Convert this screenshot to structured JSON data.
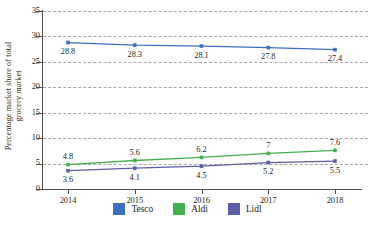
{
  "chart_data": {
    "type": "line",
    "title": "",
    "xlabel": "",
    "ylabel": "Percentage market share of total grocery market",
    "ylabel_lines": [
      "Percentage market share of total",
      "grocery market"
    ],
    "categories": [
      "2014",
      "2015",
      "2016",
      "2017",
      "2018"
    ],
    "x": [
      2014,
      2015,
      2016,
      2017,
      2018
    ],
    "ylim": [
      0,
      35
    ],
    "ytick_step": 5,
    "yticks": [
      "0",
      "5",
      "10",
      "15",
      "20",
      "25",
      "30",
      "35"
    ],
    "grid": true,
    "grid_style": "dashed-horizontal",
    "legend_position": "bottom-center",
    "data_labels": true,
    "series": [
      {
        "name": "Tesco",
        "color": "#3a6fc4",
        "values": [
          28.8,
          28.3,
          28.1,
          27.8,
          27.4
        ],
        "labels": [
          "28.8",
          "28.3",
          "28.1",
          "27.8",
          "27.4"
        ],
        "label_position": "below"
      },
      {
        "name": "Aldi",
        "color": "#42b04a",
        "values": [
          4.8,
          5.6,
          6.2,
          7,
          7.6
        ],
        "labels": [
          "4.8",
          "5.6",
          "6.2",
          "7",
          "7.6"
        ],
        "label_position": "above"
      },
      {
        "name": "Lidl",
        "color": "#5b5ea6",
        "values": [
          3.6,
          4.1,
          4.5,
          5.2,
          5.5
        ],
        "labels": [
          "3.6",
          "4.1",
          "4.5",
          "5.2",
          "5.5"
        ],
        "label_position": "below"
      }
    ]
  },
  "legend": {
    "items": [
      {
        "label": "Tesco",
        "color": "#3a6fc4"
      },
      {
        "label": "Aldi",
        "color": "#42b04a"
      },
      {
        "label": "Lidl",
        "color": "#5b5ea6"
      }
    ]
  }
}
